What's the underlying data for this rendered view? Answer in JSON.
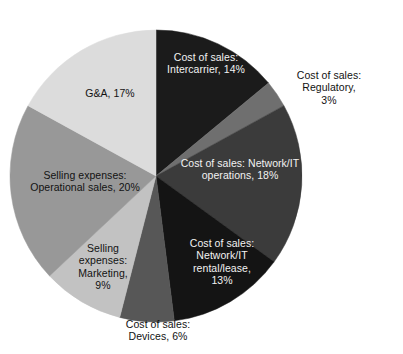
{
  "chart_data": {
    "type": "pie",
    "title": "",
    "subtitle": "",
    "xlabel": "",
    "ylabel": "",
    "legend_position": "none",
    "grid": false,
    "units": "percent",
    "start_angle_deg": 0,
    "direction": "clockwise",
    "categories": [
      "Cost of sales: Intercarrier",
      "Cost of sales: Regulatory",
      "Cost of sales: Network/IT operations",
      "Cost of sales: Network/IT rental/lease",
      "Cost of sales: Devices",
      "Selling expenses: Marketing",
      "Selling expenses: Operational sales",
      "G&A"
    ],
    "values": [
      14,
      3,
      18,
      13,
      6,
      9,
      20,
      17
    ],
    "colors": [
      "#1b1b1b",
      "#6f6f6f",
      "#3b3b3b",
      "#141414",
      "#575757",
      "#c2c2c2",
      "#989898",
      "#dcdcdc"
    ],
    "slices": [
      {
        "name": "cost-of-sales-intercarrier",
        "label": "Cost of sales:\nIntercarrier, 14%",
        "category": "Cost of sales: Intercarrier",
        "value": 14,
        "color": "#1b1b1b",
        "text_color": "light",
        "label_x": 206,
        "label_y": 63
      },
      {
        "name": "cost-of-sales-regulatory",
        "label": "Cost of sales: Regulatory,\n3%",
        "category": "Cost of sales: Regulatory",
        "value": 3,
        "color": "#6f6f6f",
        "text_color": "dark",
        "label_x": 329,
        "label_y": 88
      },
      {
        "name": "cost-of-sales-network-it-operations",
        "label": "Cost of sales: Network/IT\noperations, 18%",
        "category": "Cost of sales: Network/IT operations",
        "value": 18,
        "color": "#3b3b3b",
        "text_color": "light",
        "label_x": 240,
        "label_y": 169
      },
      {
        "name": "cost-of-sales-network-it-rental-lease",
        "label": "Cost of sales:\nNetwork/IT\nrental/lease,\n13%",
        "category": "Cost of sales: Network/IT rental/lease",
        "value": 13,
        "color": "#141414",
        "text_color": "light",
        "label_x": 222,
        "label_y": 262
      },
      {
        "name": "cost-of-sales-devices",
        "label": "Cost of sales:\nDevices, 6%",
        "category": "Cost of sales: Devices",
        "value": 6,
        "color": "#575757",
        "text_color": "dark",
        "label_x": 158,
        "label_y": 330
      },
      {
        "name": "selling-expenses-marketing",
        "label": "Selling\nexpenses:\nMarketing,\n9%",
        "category": "Selling expenses: Marketing",
        "value": 9,
        "color": "#c2c2c2",
        "text_color": "dark",
        "label_x": 103,
        "label_y": 267
      },
      {
        "name": "selling-expenses-operational-sales",
        "label": "Selling expenses:\nOperational sales, 20%",
        "category": "Selling expenses: Operational sales",
        "value": 20,
        "color": "#989898",
        "text_color": "dark",
        "label_x": 85,
        "label_y": 181
      },
      {
        "name": "g-and-a",
        "label": "G&A, 17%",
        "category": "G&A",
        "value": 17,
        "color": "#dcdcdc",
        "text_color": "dark",
        "label_x": 110,
        "label_y": 93
      }
    ]
  },
  "geometry": {
    "center_x": 156,
    "center_y": 176,
    "radius": 146
  }
}
